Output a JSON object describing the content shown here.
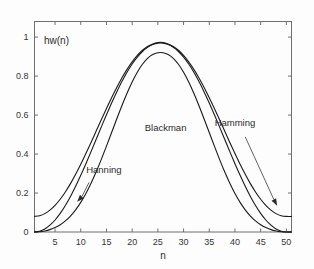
{
  "chart_data": {
    "type": "line",
    "title": "",
    "subtitle": "",
    "corner_label": "hw(n)",
    "xlabel": "n",
    "ylabel": "",
    "xlim": [
      1,
      51
    ],
    "ylim": [
      0,
      1.08
    ],
    "xticks": [
      5,
      10,
      15,
      20,
      25,
      30,
      35,
      40,
      45,
      50
    ],
    "xticklabels": [
      "5",
      "10",
      "15",
      "20",
      "25",
      "30",
      "35",
      "40",
      "45",
      "50"
    ],
    "yticks": [
      0,
      0.2,
      0.4,
      0.6,
      0.8,
      1
    ],
    "yticklabels": [
      "0",
      "0.2",
      "0.4",
      "0.6",
      "0.8",
      "1"
    ],
    "grid": false,
    "legend": "none",
    "annotations": [
      {
        "text": "Blackman",
        "kind": "text",
        "x": 26.5,
        "y": 0.52
      },
      {
        "text": "Hanning",
        "kind": "arrow",
        "x": 14.5,
        "y": 0.305,
        "tip_x": 9.3,
        "tip_y": 0.155
      },
      {
        "text": "Hamming",
        "kind": "arrow",
        "x": 40.0,
        "y": 0.545,
        "tip_x": 48.2,
        "tip_y": 0.135
      }
    ],
    "series": [
      {
        "name": "Hanning",
        "n": [
          1,
          2,
          3,
          4,
          5,
          6,
          7,
          8,
          9,
          10,
          11,
          12,
          13,
          14,
          15,
          16,
          17,
          18,
          19,
          20,
          21,
          22,
          23,
          24,
          25,
          26,
          27,
          28,
          29,
          30,
          31,
          32,
          33,
          34,
          35,
          36,
          37,
          38,
          39,
          40,
          41,
          42,
          43,
          44,
          45,
          46,
          47,
          48,
          49,
          50,
          51
        ],
        "values": [
          0,
          0.0039,
          0.0156,
          0.0349,
          0.0615,
          0.0955,
          0.1361,
          0.1827,
          0.2346,
          0.2908,
          0.3506,
          0.4125,
          0.4759,
          0.5392,
          0.6016,
          0.6617,
          0.7188,
          0.7717,
          0.8196,
          0.8618,
          0.8975,
          0.9262,
          0.9477,
          0.9615,
          0.9692,
          0.9692,
          0.9615,
          0.9477,
          0.9262,
          0.8975,
          0.8618,
          0.8196,
          0.7717,
          0.7188,
          0.6617,
          0.6016,
          0.5392,
          0.4759,
          0.4125,
          0.3506,
          0.2908,
          0.2346,
          0.1827,
          0.1361,
          0.0955,
          0.0615,
          0.0349,
          0.0156,
          0.0039,
          0,
          0
        ]
      },
      {
        "name": "Hamming",
        "n": [
          1,
          2,
          3,
          4,
          5,
          6,
          7,
          8,
          9,
          10,
          11,
          12,
          13,
          14,
          15,
          16,
          17,
          18,
          19,
          20,
          21,
          22,
          23,
          24,
          25,
          26,
          27,
          28,
          29,
          30,
          31,
          32,
          33,
          34,
          35,
          36,
          37,
          38,
          39,
          40,
          41,
          42,
          43,
          44,
          45,
          46,
          47,
          48,
          49,
          50,
          51
        ],
        "values": [
          0.08,
          0.0836,
          0.0943,
          0.1121,
          0.1366,
          0.1679,
          0.2052,
          0.2481,
          0.2959,
          0.3476,
          0.4027,
          0.4597,
          0.518,
          0.5763,
          0.6337,
          0.689,
          0.7416,
          0.7903,
          0.8343,
          0.8732,
          0.906,
          0.9324,
          0.9522,
          0.9649,
          0.972,
          0.972,
          0.9649,
          0.9522,
          0.9324,
          0.906,
          0.8732,
          0.8343,
          0.7903,
          0.7416,
          0.689,
          0.6337,
          0.5763,
          0.518,
          0.4597,
          0.4027,
          0.3476,
          0.2959,
          0.2481,
          0.2052,
          0.1679,
          0.1366,
          0.1121,
          0.0943,
          0.0836,
          0.08,
          0.08
        ]
      },
      {
        "name": "Blackman",
        "n": [
          1,
          2,
          3,
          4,
          5,
          6,
          7,
          8,
          9,
          10,
          11,
          12,
          13,
          14,
          15,
          16,
          17,
          18,
          19,
          20,
          21,
          22,
          23,
          24,
          25,
          26,
          27,
          28,
          29,
          30,
          31,
          32,
          33,
          34,
          35,
          36,
          37,
          38,
          39,
          40,
          41,
          42,
          43,
          44,
          45,
          46,
          47,
          48,
          49,
          50,
          51
        ],
        "values": [
          0,
          0.0013,
          0.0053,
          0.0122,
          0.0227,
          0.0372,
          0.0567,
          0.0819,
          0.1136,
          0.1522,
          0.1978,
          0.2503,
          0.309,
          0.3728,
          0.4405,
          0.5102,
          0.58,
          0.6479,
          0.7118,
          0.7697,
          0.8198,
          0.8607,
          0.8913,
          0.911,
          0.9198,
          0.9198,
          0.911,
          0.8913,
          0.8607,
          0.8198,
          0.7697,
          0.7118,
          0.6479,
          0.58,
          0.5102,
          0.4405,
          0.3728,
          0.309,
          0.2503,
          0.1978,
          0.1522,
          0.1136,
          0.0819,
          0.0567,
          0.0372,
          0.0227,
          0.0122,
          0.0053,
          0.0013,
          0,
          0
        ]
      }
    ]
  },
  "colors": {
    "background": "#fdfdfd",
    "axis": "#6f6f6f",
    "curve": "#1a1a1a",
    "text": "#2b2b2b"
  }
}
